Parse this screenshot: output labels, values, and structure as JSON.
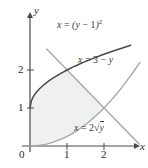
{
  "chart_data": {
    "type": "line",
    "title": "",
    "xlabel": "x",
    "ylabel": "y",
    "xlim": [
      -0.25,
      3.05
    ],
    "ylim": [
      -0.35,
      3.1
    ],
    "grid": false,
    "legend": "inline-annotations",
    "xticks": [
      0,
      1,
      2
    ],
    "xtick_labels": [
      "0",
      "1",
      "2"
    ],
    "yticks": [
      1,
      2
    ],
    "ytick_labels": [
      "1",
      "2"
    ],
    "origin_label": "0",
    "series": [
      {
        "name": "x = (y - 1)^2",
        "expression_parts": {
          "lhs": "x",
          "eq": "=",
          "open": "(",
          "var": "y",
          "minus": "−",
          "one": "1",
          "close": ")",
          "power": "2"
        },
        "color": "#4a4a4a",
        "role": "upper-boundary",
        "points_xy": [
          [
            0.0,
            1.0
          ],
          [
            0.04,
            1.2
          ],
          [
            0.09,
            1.3
          ],
          [
            0.16,
            1.4
          ],
          [
            0.25,
            1.5
          ],
          [
            0.36,
            1.6
          ],
          [
            0.49,
            1.7
          ],
          [
            0.64,
            1.8
          ],
          [
            0.81,
            1.9
          ],
          [
            1.0,
            2.0
          ],
          [
            1.21,
            2.1
          ],
          [
            1.44,
            2.2
          ],
          [
            1.69,
            2.3
          ],
          [
            1.96,
            2.4
          ],
          [
            2.25,
            2.5
          ],
          [
            2.56,
            2.6
          ],
          [
            2.72,
            2.65
          ]
        ]
      },
      {
        "name": "x = 3 - y",
        "expression_parts": {
          "lhs": "x",
          "eq": "=",
          "three": "3",
          "minus": "−",
          "var": "y"
        },
        "color": "#a8a8a8",
        "role": "line",
        "points_xy": [
          [
            0.45,
            2.55
          ],
          [
            2.95,
            0.05
          ]
        ]
      },
      {
        "name": "x = 2√y",
        "expression_parts": {
          "lhs": "x",
          "eq": "=",
          "two": "2",
          "radical": "√",
          "var": "y"
        },
        "color": "#a8a8a8",
        "role": "lower-boundary",
        "points_xy": [
          [
            0.0,
            0.0
          ],
          [
            0.2,
            0.01
          ],
          [
            0.45,
            0.05
          ],
          [
            0.63,
            0.1
          ],
          [
            0.89,
            0.2
          ],
          [
            1.1,
            0.3
          ],
          [
            1.26,
            0.4
          ],
          [
            1.41,
            0.5
          ],
          [
            1.55,
            0.6
          ],
          [
            1.67,
            0.7
          ],
          [
            1.79,
            0.8
          ],
          [
            1.9,
            0.9
          ],
          [
            2.0,
            1.0
          ],
          [
            2.19,
            1.2
          ],
          [
            2.37,
            1.4
          ],
          [
            2.53,
            1.6
          ],
          [
            2.68,
            1.8
          ],
          [
            2.83,
            2.0
          ],
          [
            2.97,
            2.2
          ]
        ]
      }
    ],
    "shaded_region": {
      "label": "region between curves",
      "fill": "#eef0f2",
      "vertices_xy": [
        [
          0.0,
          1.0
        ],
        [
          0.04,
          1.2
        ],
        [
          0.09,
          1.3
        ],
        [
          0.16,
          1.4
        ],
        [
          0.25,
          1.5
        ],
        [
          0.36,
          1.6
        ],
        [
          0.49,
          1.7
        ],
        [
          0.64,
          1.8
        ],
        [
          0.81,
          1.9
        ],
        [
          1.0,
          2.0
        ],
        [
          1.05,
          1.95
        ],
        [
          1.5,
          1.5
        ],
        [
          2.0,
          1.0
        ],
        [
          1.9,
          0.9
        ],
        [
          1.79,
          0.8
        ],
        [
          1.67,
          0.7
        ],
        [
          1.55,
          0.6
        ],
        [
          1.41,
          0.5
        ],
        [
          1.26,
          0.4
        ],
        [
          1.1,
          0.3
        ],
        [
          0.89,
          0.2
        ],
        [
          0.63,
          0.1
        ],
        [
          0.45,
          0.05
        ],
        [
          0.2,
          0.01
        ],
        [
          0.0,
          0.0
        ]
      ]
    },
    "annotations": [
      {
        "name": "curve-label-parabola",
        "text": "x = (y − 1)²",
        "x_px": 57,
        "y_px": 24
      },
      {
        "name": "curve-label-line",
        "text": "x = 3 − y",
        "x_px": 78,
        "y_px": 60
      },
      {
        "name": "curve-label-sqrt",
        "text": "x = 2√y",
        "x_px": 74,
        "y_px": 128
      }
    ],
    "colors": {
      "axis": "#4a4a4a",
      "parabola": "#4a4a4a",
      "line": "#a8a8a8",
      "sqrt": "#a8a8a8",
      "fill": "#eef0f2",
      "text": "#2b2b2b",
      "background": "#ffffff"
    },
    "geometry_px": {
      "origin_x": 30,
      "origin_y": 146,
      "unit_x": 37,
      "unit_y": 38
    }
  },
  "axes": {
    "x_label": "x",
    "y_label": "y",
    "origin_label": "0",
    "x_tick_1": "1",
    "x_tick_2": "2",
    "y_tick_1": "1",
    "y_tick_2": "2"
  }
}
